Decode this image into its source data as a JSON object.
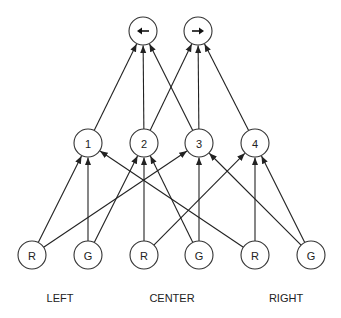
{
  "diagram": {
    "type": "neural-network",
    "layers": {
      "output": [
        {
          "id": "left-out",
          "icon": "arrow-left-icon",
          "glyph": "left"
        },
        {
          "id": "right-out",
          "icon": "arrow-right-icon",
          "glyph": "right"
        }
      ],
      "hidden": [
        {
          "id": "h1",
          "label": "1"
        },
        {
          "id": "h2",
          "label": "2"
        },
        {
          "id": "h3",
          "label": "3"
        },
        {
          "id": "h4",
          "label": "4"
        }
      ],
      "input": [
        {
          "id": "in-left-r",
          "label": "R",
          "group": "LEFT"
        },
        {
          "id": "in-left-g",
          "label": "G",
          "group": "LEFT"
        },
        {
          "id": "in-center-r",
          "label": "R",
          "group": "CENTER"
        },
        {
          "id": "in-center-g",
          "label": "G",
          "group": "CENTER"
        },
        {
          "id": "in-right-r",
          "label": "R",
          "group": "RIGHT"
        },
        {
          "id": "in-right-g",
          "label": "G",
          "group": "RIGHT"
        }
      ]
    },
    "groups": [
      "LEFT",
      "CENTER",
      "RIGHT"
    ],
    "edges": [
      [
        "in-left-r",
        "h1"
      ],
      [
        "in-left-r",
        "h3"
      ],
      [
        "in-left-g",
        "h1"
      ],
      [
        "in-left-g",
        "h2"
      ],
      [
        "in-center-r",
        "h2"
      ],
      [
        "in-center-r",
        "h4"
      ],
      [
        "in-center-g",
        "h2"
      ],
      [
        "in-center-g",
        "h3"
      ],
      [
        "in-right-r",
        "h1"
      ],
      [
        "in-right-r",
        "h4"
      ],
      [
        "in-right-g",
        "h3"
      ],
      [
        "in-right-g",
        "h4"
      ],
      [
        "h1",
        "left-out"
      ],
      [
        "h2",
        "left-out"
      ],
      [
        "h3",
        "left-out"
      ],
      [
        "h2",
        "right-out"
      ],
      [
        "h3",
        "right-out"
      ],
      [
        "h4",
        "right-out"
      ]
    ]
  }
}
